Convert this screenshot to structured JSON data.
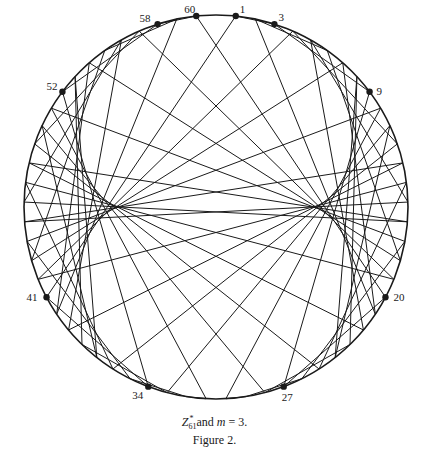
{
  "figure": {
    "modulus": 61,
    "multiplier": 3,
    "center": [
      216,
      207
    ],
    "radius": 192,
    "line_color": "#1a1a1a",
    "circle_color": "#1a1a1a",
    "marked_points": [
      {
        "label": "1",
        "k": 1,
        "dx": 4,
        "dy": -3
      },
      {
        "label": "3",
        "k": 3,
        "dx": 4,
        "dy": -3
      },
      {
        "label": "9",
        "k": 9,
        "dx": 7,
        "dy": 3
      },
      {
        "label": "27",
        "k": 27,
        "dx": -2,
        "dy": 14
      },
      {
        "label": "20",
        "k": 20,
        "dx": 8,
        "dy": 4
      },
      {
        "label": "60",
        "k": 60,
        "dx": -12,
        "dy": -3
      },
      {
        "label": "58",
        "k": 58,
        "dx": -18,
        "dy": -2
      },
      {
        "label": "52",
        "k": 52,
        "dx": -16,
        "dy": -2
      },
      {
        "label": "34",
        "k": 34,
        "dx": -16,
        "dy": 12
      },
      {
        "label": "41",
        "k": 41,
        "dx": -20,
        "dy": 4
      }
    ]
  },
  "caption": {
    "set_symbol": "Z",
    "set_sub": "61",
    "set_sup": "*",
    "text_and": " and ",
    "m_symbol": "m",
    "m_value": " = 3.",
    "figure_label": "Figure 2."
  }
}
